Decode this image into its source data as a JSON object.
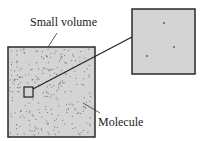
{
  "labels": {
    "small_volume": "Small volume",
    "molecule": "Molecule"
  },
  "colors": {
    "fill": "#d4d4d4",
    "border": "#2a2a2a",
    "dot": "#6e6e6e"
  }
}
